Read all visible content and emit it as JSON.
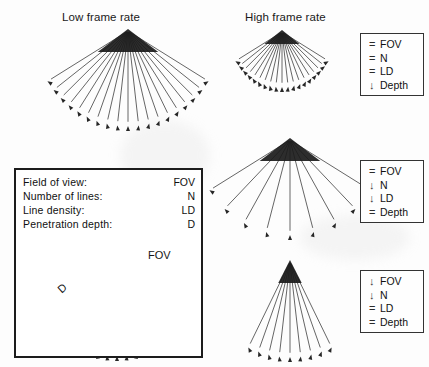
{
  "figure": {
    "titles": {
      "low": "Low frame rate",
      "high": "High frame rate"
    }
  },
  "definitions": {
    "rows": [
      {
        "term": "Field of view:",
        "abbr": "FOV"
      },
      {
        "term": "Number of lines:",
        "abbr": "N"
      },
      {
        "term": "Line density:",
        "abbr": "LD"
      },
      {
        "term": "Penetration depth:",
        "abbr": "D"
      }
    ],
    "diagram": {
      "fov_label": "FOV",
      "depth_label": "D"
    }
  },
  "legends": [
    {
      "id": "legend-top",
      "rows": [
        {
          "symbol": "=",
          "label": "FOV"
        },
        {
          "symbol": "=",
          "label": "N"
        },
        {
          "symbol": "=",
          "label": "LD"
        },
        {
          "symbol": "↓",
          "label": "Depth"
        }
      ]
    },
    {
      "id": "legend-middle",
      "rows": [
        {
          "symbol": "=",
          "label": "FOV"
        },
        {
          "symbol": "↓",
          "label": "N"
        },
        {
          "symbol": "↓",
          "label": "LD"
        },
        {
          "symbol": "=",
          "label": "Depth"
        }
      ]
    },
    {
      "id": "legend-bottom",
      "rows": [
        {
          "symbol": "↓",
          "label": "FOV"
        },
        {
          "symbol": "↓",
          "label": "N"
        },
        {
          "symbol": "=",
          "label": "LD"
        },
        {
          "symbol": "=",
          "label": "Depth"
        }
      ]
    }
  ],
  "chart_data": {
    "type": "diagram",
    "fans": [
      {
        "name": "low-frame-rate-fan",
        "apex_x": 128,
        "apex_y": 31,
        "radius": 95,
        "half_angle_deg": 58,
        "line_count": 19,
        "description": "Wide field of view, many lines, full penetration depth"
      },
      {
        "name": "high-frame-rate-fan-shallow",
        "apex_x": 282,
        "apex_y": 32,
        "radius": 55,
        "half_angle_deg": 58,
        "line_count": 19,
        "description": "Wide FOV, many lines, reduced depth"
      },
      {
        "name": "high-frame-rate-fan-sparse",
        "apex_x": 290,
        "apex_y": 140,
        "radius": 95,
        "half_angle_deg": 58,
        "line_count": 9,
        "description": "Wide FOV, fewer lines, full depth"
      },
      {
        "name": "high-frame-rate-fan-narrow",
        "apex_x": 290,
        "apex_y": 262,
        "radius": 95,
        "half_angle_deg": 26,
        "line_count": 9,
        "description": "Narrow FOV, fewer lines, full depth"
      },
      {
        "name": "definition-reference-fan",
        "apex_x": 117,
        "apex_y": 266,
        "radius": 90,
        "half_angle_deg": 58,
        "line_count": 19,
        "description": "Reference fan annotated with FOV arc and depth D"
      }
    ],
    "colors": {
      "ray": "#333333",
      "border": "#1c1c1c",
      "text": "#111111",
      "background": "#ffffff"
    }
  }
}
